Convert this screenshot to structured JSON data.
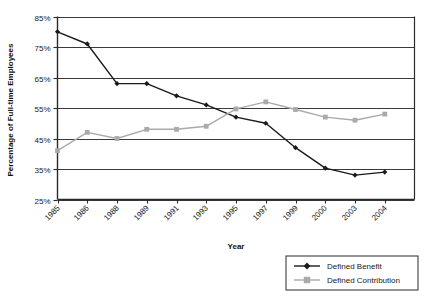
{
  "chart_data": {
    "type": "line",
    "title": "",
    "xlabel": "Year",
    "ylabel": "Percentage of Full-time Employees",
    "categories": [
      "1985",
      "1986",
      "1988",
      "1989",
      "1991",
      "1993",
      "1995",
      "1997",
      "1999",
      "2000",
      "2003",
      "2004"
    ],
    "ylim": [
      25,
      85
    ],
    "yticks": [
      "25%",
      "35%",
      "45%",
      "55%",
      "65%",
      "75%",
      "85%"
    ],
    "ytick_values": [
      25,
      35,
      45,
      55,
      65,
      75,
      85
    ],
    "grid": true,
    "legend_position": "bottom-right",
    "series": [
      {
        "name": "Defined Benefit",
        "color": "#1a1a1a",
        "marker": "diamond",
        "values": [
          80,
          76,
          63,
          63,
          59,
          56,
          52,
          50,
          42,
          35.3,
          33,
          34
        ]
      },
      {
        "name": "Defined Contribution",
        "color": "#aaaaaa",
        "marker": "square",
        "values": [
          41,
          47,
          45,
          48,
          48,
          49,
          54.7,
          57,
          54.5,
          52,
          51,
          53
        ]
      }
    ]
  },
  "axes": {
    "x_title": "Year",
    "y_title": "Percentage of Full-time Employees"
  },
  "legend": {
    "items": [
      {
        "label": "Defined Benefit"
      },
      {
        "label": "Defined Contribution"
      }
    ]
  },
  "colors": {
    "defined_benefit": "#1a1a1a",
    "defined_contribution": "#aaaaaa",
    "grid": "#3a3a3a",
    "axis": "#2a2a2a",
    "background": "#ffffff"
  }
}
